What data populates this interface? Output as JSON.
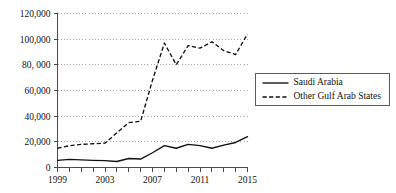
{
  "chart_data": {
    "type": "line",
    "title": "",
    "xlabel": "",
    "ylabel": "",
    "x": [
      1999,
      2000,
      2001,
      2002,
      2003,
      2004,
      2005,
      2006,
      2007,
      2008,
      2009,
      2010,
      2011,
      2012,
      2013,
      2014,
      2015
    ],
    "xlim": [
      1999,
      2015
    ],
    "ylim": [
      0,
      120000
    ],
    "grid": true,
    "legend_position": "right",
    "x_tick_labels": [
      "1999",
      "",
      "",
      "",
      "2003",
      "",
      "",
      "",
      "2007",
      "",
      "",
      "",
      "2011",
      "",
      "",
      "",
      "2015"
    ],
    "y_ticks": [
      0,
      20000,
      40000,
      60000,
      80000,
      100000,
      120000
    ],
    "y_tick_labels": [
      "0",
      "20,000",
      "40,000",
      "60,000",
      "80, 000",
      "100,000",
      "120,000"
    ],
    "series": [
      {
        "name": "Saudi Arabia",
        "style": "solid",
        "values": [
          5500,
          6300,
          6000,
          5600,
          5300,
          4700,
          7000,
          6600,
          11500,
          17000,
          15000,
          18000,
          17000,
          15000,
          17500,
          19500,
          24000
        ]
      },
      {
        "name": "Other Gulf Arab States",
        "style": "dashed",
        "values": [
          15000,
          17000,
          18000,
          18500,
          19000,
          27000,
          35000,
          36000,
          68000,
          97000,
          80000,
          95000,
          93000,
          98000,
          91000,
          88000,
          104000
        ]
      }
    ]
  },
  "legend": {
    "items": [
      {
        "label": "Saudi Arabia",
        "style": "solid"
      },
      {
        "label": "Other Gulf Arab States",
        "style": "dashed"
      }
    ]
  }
}
